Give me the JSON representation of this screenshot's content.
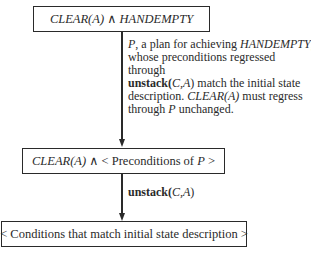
{
  "diagram": {
    "top_box": {
      "part1": "CLEAR(A)",
      "conj": " ∧ ",
      "part2": "HANDEMPTY"
    },
    "plan_note": {
      "line1_italic_a": "P",
      "line1_text": ", a plan for achieving ",
      "line1_italic_b": "HANDEMPTY",
      "line1_end": ",",
      "line2": "whose preconditions regressed through",
      "line3_bold": "unstack(",
      "line3_args": "C,A",
      "line3_close": ")",
      "line3_text": " match the initial state",
      "line4_text": "description. ",
      "line4_italic": "CLEAR(A)",
      "line4_end": " must regress",
      "line5_text": "through ",
      "line5_italic": "P",
      "line5_end": " unchanged."
    },
    "middle_box": {
      "part1": "CLEAR(A)",
      "conj": " ∧ ",
      "part2": "< Preconditions of ",
      "part3": "P",
      "part4": " >"
    },
    "operator_label": {
      "bold": "unstack(",
      "args": "C,A",
      "close": ")"
    },
    "bottom_box": {
      "text": "< Conditions that match initial state description >"
    }
  }
}
